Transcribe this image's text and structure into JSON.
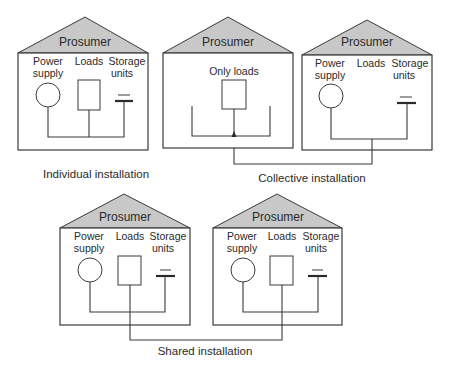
{
  "houses": [
    {
      "id": "individual",
      "title": "Prosumer",
      "labels": {
        "power_line1": "Power",
        "power_line2": "supply",
        "loads": "Loads",
        "storage_line1": "Storage",
        "storage_line2": "units"
      }
    },
    {
      "id": "collective-left",
      "title": "Prosumer",
      "labels": {
        "only_loads": "Only loads"
      }
    },
    {
      "id": "collective-right",
      "title": "Prosumer",
      "labels": {
        "power_line1": "Power",
        "power_line2": "supply",
        "loads": "Loads",
        "storage_line1": "Storage",
        "storage_line2": "units"
      }
    },
    {
      "id": "shared-left",
      "title": "Prosumer",
      "labels": {
        "power_line1": "Power",
        "power_line2": "supply",
        "loads": "Loads",
        "storage_line1": "Storage",
        "storage_line2": "units"
      }
    },
    {
      "id": "shared-right",
      "title": "Prosumer",
      "labels": {
        "power_line1": "Power",
        "power_line2": "supply",
        "loads": "Loads",
        "storage_line1": "Storage",
        "storage_line2": "units"
      }
    }
  ],
  "captions": {
    "individual": "Individual installation",
    "collective": "Collective installation",
    "shared": "Shared installation"
  },
  "colors": {
    "roof": "#c8c8c8",
    "stroke": "#3a3a3a",
    "background": "#ffffff"
  }
}
